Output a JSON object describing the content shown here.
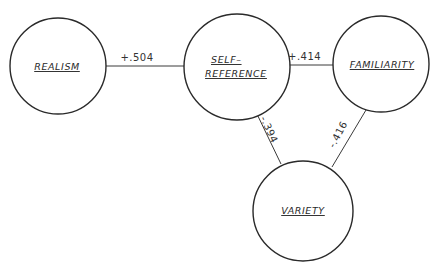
{
  "diagram": {
    "type": "correlation-network",
    "colors": {
      "stroke": "#2a2a2a",
      "background": "#ffffff",
      "text": "#2a2a2a"
    },
    "nodes": [
      {
        "id": "realism",
        "label": "REALISM",
        "lines": [
          "REALISM"
        ]
      },
      {
        "id": "self-reference",
        "label": "SELF-REFERENCE",
        "lines": [
          "SELF–",
          "REFERENCE"
        ]
      },
      {
        "id": "familiarity",
        "label": "FAMILIARITY",
        "lines": [
          "FAMILIARITY"
        ]
      },
      {
        "id": "variety",
        "label": "VARIETY",
        "lines": [
          "VARIETY"
        ]
      }
    ],
    "edges": [
      {
        "from": "realism",
        "to": "self-reference",
        "label": "+.504"
      },
      {
        "from": "self-reference",
        "to": "familiarity",
        "label": "+.414"
      },
      {
        "from": "self-reference",
        "to": "variety",
        "label": "-.394"
      },
      {
        "from": "familiarity",
        "to": "variety",
        "label": "-.416"
      }
    ]
  }
}
